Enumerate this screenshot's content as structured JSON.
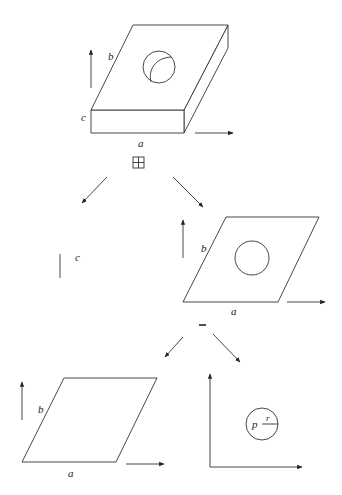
{
  "diagram": {
    "top_solid": {
      "labels": {
        "width": "a",
        "depth": "b",
        "height": "c"
      },
      "operator": "⊞"
    },
    "middle_left": {
      "label": "c"
    },
    "middle_right": {
      "labels": {
        "width": "a",
        "depth": "b"
      },
      "operator": "–"
    },
    "bottom_left": {
      "labels": {
        "width": "a",
        "depth": "b"
      }
    },
    "bottom_right": {
      "labels": {
        "center": "p",
        "radius": "r"
      }
    },
    "colors": {
      "stroke": "#333333",
      "background": "#ffffff"
    }
  }
}
